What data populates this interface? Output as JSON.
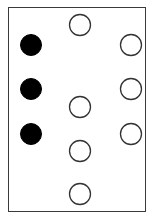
{
  "diagram": {
    "frame": {
      "x": 8,
      "y": 7,
      "width": 138,
      "height": 205,
      "stroke": "#3a3a3a"
    },
    "dot_radius": 10.5,
    "colors": {
      "filled": "#000000",
      "hollow_fill": "#ffffff",
      "hollow_stroke": "#333333"
    },
    "dots": [
      {
        "cx": 31,
        "cy": 45,
        "filled": true
      },
      {
        "cx": 31,
        "cy": 89,
        "filled": true
      },
      {
        "cx": 31,
        "cy": 134,
        "filled": true
      },
      {
        "cx": 80,
        "cy": 25,
        "filled": false
      },
      {
        "cx": 131,
        "cy": 45,
        "filled": false
      },
      {
        "cx": 131,
        "cy": 89,
        "filled": false
      },
      {
        "cx": 80,
        "cy": 107,
        "filled": false
      },
      {
        "cx": 131,
        "cy": 134,
        "filled": false
      },
      {
        "cx": 80,
        "cy": 151,
        "filled": false
      },
      {
        "cx": 80,
        "cy": 194,
        "filled": false
      }
    ],
    "counts": {
      "filled": 3,
      "hollow": 7,
      "total": 10
    }
  }
}
